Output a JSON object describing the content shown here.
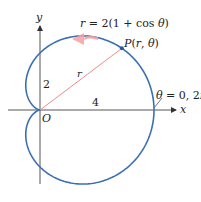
{
  "figure": {
    "equation_label": "r = 2(1 + cos θ)",
    "point_label": "P(r, θ)",
    "radius_label": "r",
    "y_intercept_label": "2",
    "x_intercept_label": "4",
    "origin_label": "O",
    "angle_label": "θ = 0, 2π",
    "x_axis_label": "x",
    "y_axis_label": "y"
  },
  "chart_data": {
    "type": "polar_curve",
    "equation": "r = 2(1 + cos θ)",
    "a": 2,
    "theta_range": [
      0,
      6.283185307
    ],
    "point_P": {
      "label": "P(r, θ)",
      "theta_deg": 37
    },
    "annotations": [
      "2",
      "4",
      "O",
      "θ = 0, 2π",
      "r"
    ],
    "xlabel": "x",
    "ylabel": "y",
    "x_intercept": 4,
    "y_intercept": 2,
    "direction": "counterclockwise"
  },
  "colors": {
    "curve": "#3a6fb5",
    "radius_line": "#f08a8a",
    "arrow": "#f4a0a0",
    "axis": "#555555"
  },
  "layout": {
    "origin_x": 40,
    "origin_y": 110,
    "scale": 28.5
  }
}
